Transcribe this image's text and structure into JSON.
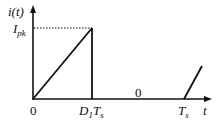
{
  "diagram": {
    "type": "waveform",
    "y_axis_label": "i(t)",
    "x_axis_label": "t",
    "peak_label": {
      "main": "I",
      "sub": "pk"
    },
    "x_ticks": [
      {
        "main": "0",
        "sub": ""
      },
      {
        "main": "D",
        "sub": "1",
        "suffix": "T",
        "suffix_sub": "s"
      },
      {
        "main": "T",
        "sub": "s"
      }
    ],
    "interval_label": "0",
    "colors": {
      "line": "#111111",
      "background": "#ffffff"
    }
  }
}
